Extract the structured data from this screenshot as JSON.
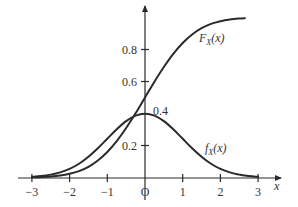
{
  "chart_data": {
    "type": "line",
    "title": "",
    "xlabel": "x",
    "ylabel": "",
    "xlim": [
      -3,
      3
    ],
    "ylim": [
      0,
      1
    ],
    "grid": false,
    "legend": "inline labels",
    "x_ticks": [
      "−3",
      "−2",
      "−1",
      "O",
      "1",
      "2",
      "3"
    ],
    "x_tick_values": [
      -3,
      -2,
      -1,
      0,
      1,
      2,
      3
    ],
    "y_ticks": [
      "0.2",
      "0.4",
      "0.6",
      "0.8"
    ],
    "y_tick_values": [
      0.2,
      0.4,
      0.6,
      0.8
    ],
    "annotations": [
      {
        "text": "0.4",
        "x": 0,
        "y": 0.4
      }
    ],
    "x": [
      -3,
      -2.75,
      -2.5,
      -2.25,
      -2,
      -1.75,
      -1.5,
      -1.25,
      -1,
      -0.75,
      -0.5,
      -0.25,
      0,
      0.25,
      0.5,
      0.75,
      1,
      1.25,
      1.5,
      1.75,
      2,
      2.25,
      2.5,
      2.65
    ],
    "series": [
      {
        "name": "F_X(x)",
        "label_main": "F",
        "label_sub": "X",
        "label_arg": "(x)",
        "values": [
          0.001,
          0.003,
          0.006,
          0.012,
          0.023,
          0.04,
          0.067,
          0.106,
          0.159,
          0.227,
          0.309,
          0.401,
          0.5,
          0.599,
          0.691,
          0.773,
          0.841,
          0.894,
          0.933,
          0.96,
          0.977,
          0.988,
          0.994,
          0.996
        ]
      },
      {
        "name": "f_X(x)",
        "label_main": "f",
        "label_sub": "X",
        "label_arg": "(x)",
        "values": [
          0.004,
          0.009,
          0.018,
          0.032,
          0.054,
          0.086,
          0.13,
          0.183,
          0.242,
          0.301,
          0.352,
          0.387,
          0.399,
          0.387,
          0.352,
          0.301,
          0.242,
          0.183,
          0.13,
          0.086,
          0.054,
          0.032,
          0.018,
          0.012
        ]
      }
    ],
    "f_tail": {
      "x": [
        2.65,
        3
      ],
      "values": [
        0.004,
        0.004
      ]
    }
  }
}
